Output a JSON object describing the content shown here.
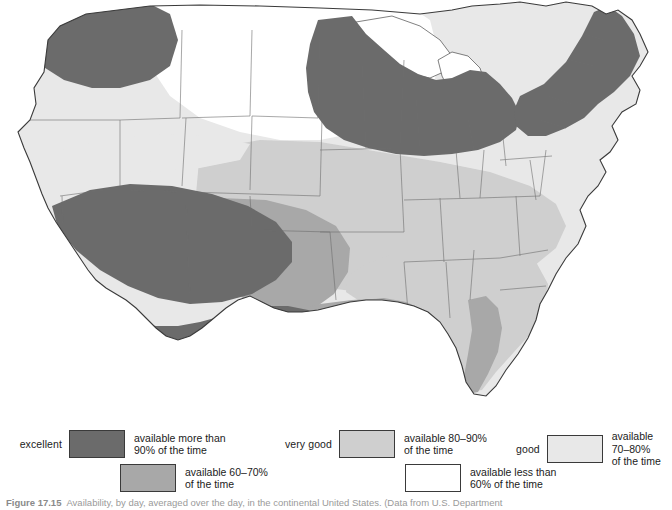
{
  "figure": {
    "caption_figure_number": "Figure 17.15",
    "caption_text": "Availability, by day, averaged over the day, in the continental United States. (Data from U.S. Department"
  },
  "map": {
    "title": "Availability map of the continental United States",
    "palette": {
      "excellent": "#6b6b6b",
      "very_good": "#cfcfcf",
      "good": "#e8e8e8",
      "fair": "#a8a8a8",
      "poor": "#ffffff",
      "outline": "#3a3a3a",
      "state_border": "#555555",
      "background": "#ffffff"
    },
    "regions": [
      {
        "name": "pacific-northwest",
        "class": "excellent"
      },
      {
        "name": "northern-rockies",
        "class": "good"
      },
      {
        "name": "great-basin",
        "class": "good"
      },
      {
        "name": "desert-southwest",
        "class": "excellent"
      },
      {
        "name": "southern-california-coast",
        "class": "excellent"
      },
      {
        "name": "southern-plains",
        "class": "fair"
      },
      {
        "name": "central-plains",
        "class": "very-good"
      },
      {
        "name": "upper-midwest",
        "class": "excellent"
      },
      {
        "name": "great-lakes",
        "class": "excellent"
      },
      {
        "name": "northeast",
        "class": "excellent"
      },
      {
        "name": "mid-atlantic",
        "class": "very-good"
      },
      {
        "name": "southeast",
        "class": "very-good"
      },
      {
        "name": "gulf-coast",
        "class": "fair"
      },
      {
        "name": "florida-coast",
        "class": "fair"
      },
      {
        "name": "northern-plains-interior",
        "class": "poor"
      },
      {
        "name": "upper-great-lakes-water",
        "class": "poor"
      }
    ]
  },
  "legend": {
    "title": "Availability legend",
    "entries": [
      {
        "key": "excellent",
        "rating": "excellent",
        "description": "available more than\n90% of the time",
        "color": "#6b6b6b",
        "range_low_percent": 90,
        "range_high_percent": 100
      },
      {
        "key": "very_good",
        "rating": "very good",
        "description": "available 80–90%\nof the time",
        "color": "#cfcfcf",
        "range_low_percent": 80,
        "range_high_percent": 90
      },
      {
        "key": "good",
        "rating": "good",
        "description": "available 70–80%\nof the time",
        "color": "#e8e8e8",
        "range_low_percent": 70,
        "range_high_percent": 80
      },
      {
        "key": "fair",
        "rating": "",
        "description": "available 60–70%\nof the time",
        "color": "#a8a8a8",
        "range_low_percent": 60,
        "range_high_percent": 70
      },
      {
        "key": "poor",
        "rating": "",
        "description": "available less than\n60% of the time",
        "color": "#ffffff",
        "range_low_percent": 0,
        "range_high_percent": 60
      }
    ]
  }
}
